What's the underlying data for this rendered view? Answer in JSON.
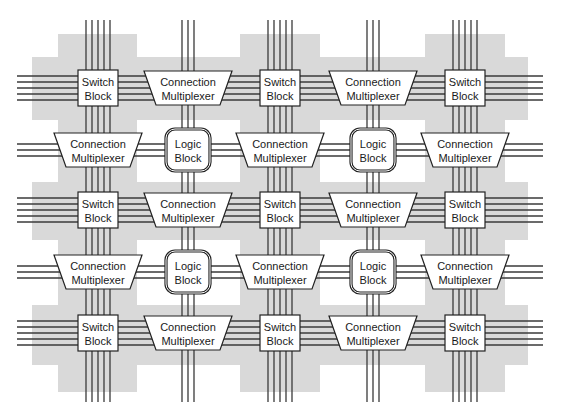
{
  "diagram": {
    "colors": {
      "background": "#ffffff",
      "routing_region": "#d9d9d9",
      "wire": "#3a3a3a",
      "block_fill": "#ffffff",
      "block_stroke": "#222222"
    },
    "columns": [
      98,
      188,
      280,
      373,
      465
    ],
    "rows": [
      88,
      150,
      210,
      272,
      333
    ],
    "switch_block": {
      "line1": "Switch",
      "line2": "Block"
    },
    "connection_multiplexer": {
      "line1": "Connection",
      "line2": "Multiplexer"
    },
    "logic_block": {
      "line1": "Logic",
      "line2": "Block"
    },
    "grid": [
      [
        "switch",
        "cmux",
        "switch",
        "cmux",
        "switch"
      ],
      [
        "cmux",
        "logic",
        "cmux",
        "logic",
        "cmux"
      ],
      [
        "switch",
        "cmux",
        "switch",
        "cmux",
        "switch"
      ],
      [
        "cmux",
        "logic",
        "cmux",
        "logic",
        "cmux"
      ],
      [
        "switch",
        "cmux",
        "switch",
        "cmux",
        "switch"
      ]
    ]
  }
}
